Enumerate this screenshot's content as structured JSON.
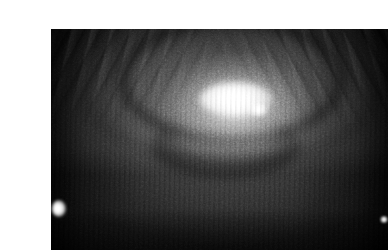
{
  "page": {
    "background_color": "#ffffff",
    "width": 356,
    "height": 250
  },
  "photo": {
    "name": "grayscale-macro-photograph",
    "alt_text": "Close-up grayscale macro photograph of skin showing a raised rounded nodule with a bright specular highlight at its apex, surrounded by a darker crease arc and mottled textured tissue.",
    "is_grayscale": true,
    "frame": {
      "left": 11,
      "top": 13,
      "width": 337,
      "height": 221
    },
    "colors": {
      "background": "#ffffff",
      "darkest_shadow": "#101010",
      "mid_tone": "#4a4a4a",
      "base_tone": "#5d5d5d",
      "light_tone": "#9a9a9a",
      "specular_highlight": "#fbfbfb",
      "edge_highlight": "#ffffff"
    },
    "features": [
      {
        "name": "specular-core",
        "label": "Bright specular highlight at nodule apex",
        "center_x_pct": 55,
        "center_y_pct": 32,
        "intensity": 252
      },
      {
        "name": "specular-secondary",
        "label": "Secondary small highlight",
        "center_x_pct": 62,
        "center_y_pct": 37,
        "intensity": 232
      },
      {
        "name": "dome-glow",
        "label": "Luminous raised dome",
        "center_x_pct": 55,
        "center_y_pct": 36,
        "intensity": 180
      },
      {
        "name": "crease-arc",
        "label": "Dark curved crease above the dome",
        "center_x_pct": 51,
        "center_y_pct": 18,
        "intensity": 34
      },
      {
        "name": "streaks-left",
        "label": "Diagonal hair-like streaks, upper left",
        "center_x_pct": 14,
        "center_y_pct": 10,
        "intensity": 62
      },
      {
        "name": "streaks-right",
        "label": "Diagonal hair-like streaks, upper right",
        "center_x_pct": 88,
        "center_y_pct": 10,
        "intensity": 60
      },
      {
        "name": "edge-highlight-left",
        "label": "Blown-out white spot on lower left edge",
        "center_x_pct": 2,
        "center_y_pct": 81,
        "intensity": 255
      },
      {
        "name": "edge-highlight-right",
        "label": "Small white dot on right edge",
        "center_x_pct": 99,
        "center_y_pct": 86,
        "intensity": 250
      },
      {
        "name": "horizontal-band",
        "label": "Darker horizontal banding in lower third",
        "center_x_pct": 50,
        "center_y_pct": 82,
        "intensity": 40
      }
    ]
  }
}
